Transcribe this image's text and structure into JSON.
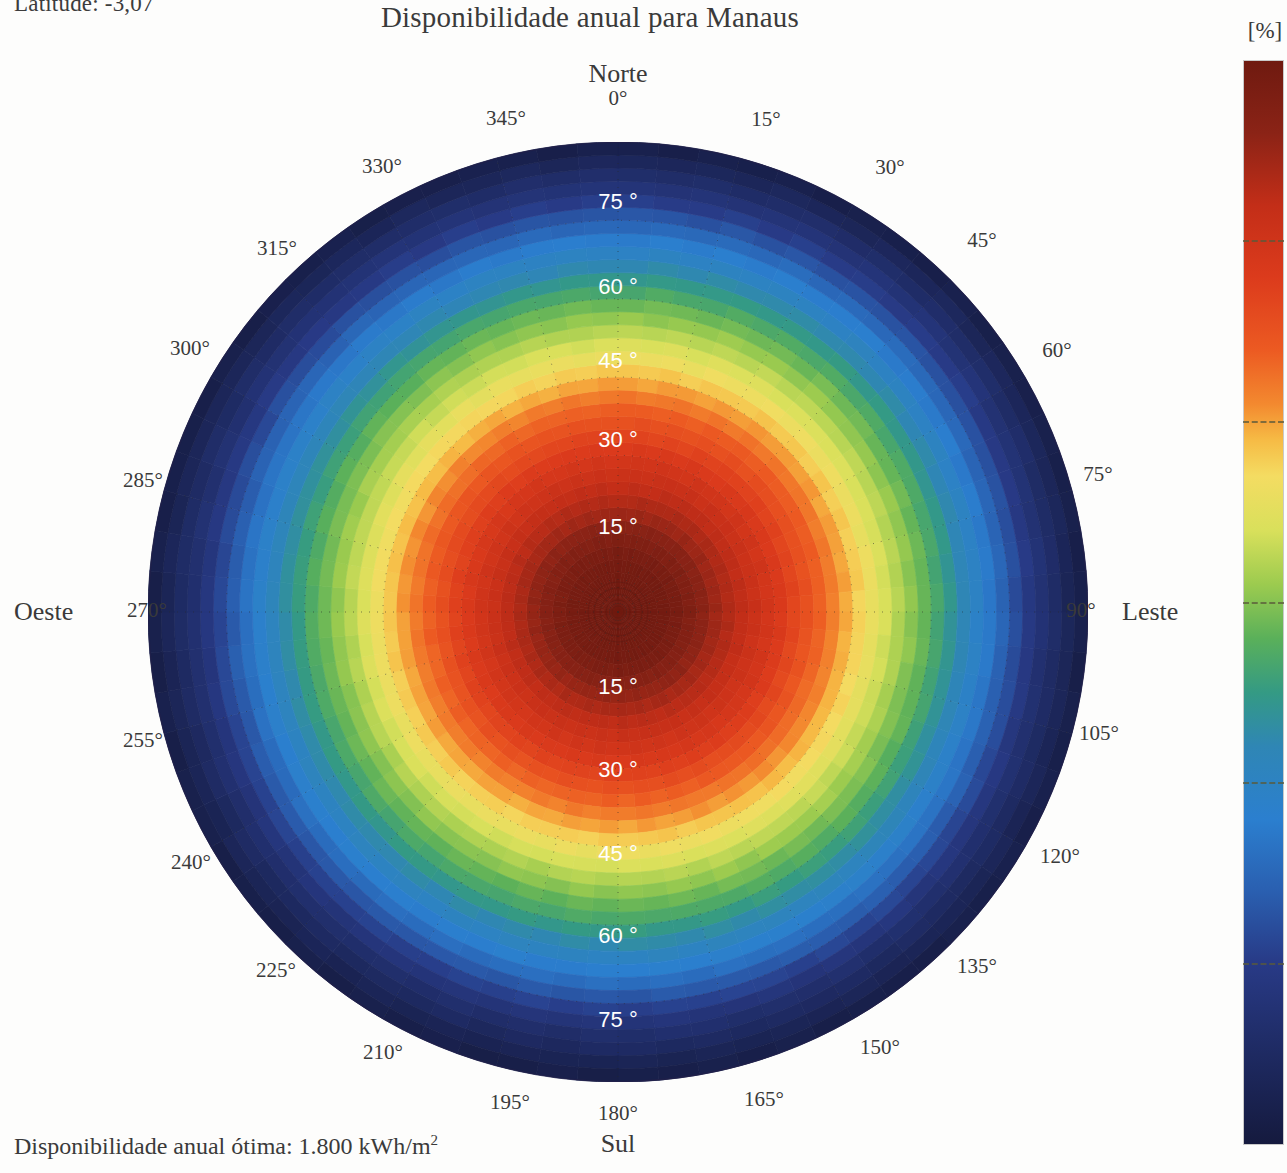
{
  "header": {
    "title": "Disponibilidade anual para Manaus",
    "latitude_note": "Latitude: -3,07"
  },
  "footer": {
    "optimum_label": "Disponibilidade anual ótima: 1.800 kWh/m",
    "optimum_exponent": "2"
  },
  "cardinals": {
    "north": "Norte",
    "south": "Sul",
    "west": "Oeste",
    "east": "Leste"
  },
  "colorbar": {
    "unit": "[%]",
    "ticks": [
      100,
      90,
      80,
      70,
      60,
      50,
      40
    ],
    "min": 40,
    "max": 100,
    "stops": [
      {
        "value": 100,
        "color": "#6f1a10"
      },
      {
        "value": 96,
        "color": "#8b2316"
      },
      {
        "value": 92,
        "color": "#c32e18"
      },
      {
        "value": 88,
        "color": "#dc3b1c"
      },
      {
        "value": 84,
        "color": "#ec5a22"
      },
      {
        "value": 81,
        "color": "#f3892f"
      },
      {
        "value": 79,
        "color": "#f6bb45"
      },
      {
        "value": 77,
        "color": "#f4dc62"
      },
      {
        "value": 74,
        "color": "#d9e05b"
      },
      {
        "value": 71,
        "color": "#9ccb4f"
      },
      {
        "value": 68,
        "color": "#5ab05a"
      },
      {
        "value": 65,
        "color": "#349a84"
      },
      {
        "value": 62,
        "color": "#2f86b5"
      },
      {
        "value": 58,
        "color": "#2b7fcf"
      },
      {
        "value": 54,
        "color": "#2a5fb0"
      },
      {
        "value": 50,
        "color": "#283a86"
      },
      {
        "value": 45,
        "color": "#1e2a62"
      },
      {
        "value": 40,
        "color": "#151a3e"
      }
    ]
  },
  "chart_data": {
    "type": "heatmap",
    "projection": "polar-skyplot",
    "title": "Disponibilidade anual para Manaus",
    "unit": "[%]",
    "zlim": [
      40,
      100
    ],
    "grid": true,
    "legend_position": "right",
    "angular_axis": {
      "name": "Azimute",
      "unit": "°",
      "range": [
        0,
        360
      ],
      "step": 15,
      "zero_at": "north",
      "direction": "clockwise",
      "tick_labels": [
        "0°",
        "15°",
        "30°",
        "45°",
        "60°",
        "75°",
        "90°",
        "105°",
        "120°",
        "135°",
        "150°",
        "165°",
        "180°",
        "195°",
        "210°",
        "225°",
        "240°",
        "255°",
        "270°",
        "285°",
        "300°",
        "315°",
        "330°",
        "345°"
      ]
    },
    "radial_axis": {
      "name": "Inclinação",
      "unit": "°",
      "range": [
        0,
        90
      ],
      "tick_labels": [
        "15 °",
        "30 °",
        "45 °",
        "60 °",
        "75 °"
      ],
      "ticks": [
        15,
        30,
        45,
        60,
        75
      ]
    },
    "radial_profile_north": [
      {
        "tilt": 0,
        "value": 100
      },
      {
        "tilt": 10,
        "value": 99
      },
      {
        "tilt": 15,
        "value": 97
      },
      {
        "tilt": 20,
        "value": 94
      },
      {
        "tilt": 30,
        "value": 89
      },
      {
        "tilt": 40,
        "value": 83
      },
      {
        "tilt": 45,
        "value": 79
      },
      {
        "tilt": 50,
        "value": 75
      },
      {
        "tilt": 60,
        "value": 68
      },
      {
        "tilt": 70,
        "value": 59
      },
      {
        "tilt": 75,
        "value": 54
      },
      {
        "tilt": 80,
        "value": 49
      },
      {
        "tilt": 90,
        "value": 41
      }
    ],
    "radial_profile_south": [
      {
        "tilt": 0,
        "value": 100
      },
      {
        "tilt": 10,
        "value": 99
      },
      {
        "tilt": 15,
        "value": 96
      },
      {
        "tilt": 20,
        "value": 93
      },
      {
        "tilt": 30,
        "value": 88
      },
      {
        "tilt": 40,
        "value": 81
      },
      {
        "tilt": 45,
        "value": 77
      },
      {
        "tilt": 50,
        "value": 73
      },
      {
        "tilt": 60,
        "value": 66
      },
      {
        "tilt": 70,
        "value": 57
      },
      {
        "tilt": 75,
        "value": 52
      },
      {
        "tilt": 80,
        "value": 47
      },
      {
        "tilt": 90,
        "value": 41
      }
    ],
    "annotations": {
      "optimum": "Disponibilidade anual ótima: 1.800 kWh/m2",
      "latitude": "Latitude: -3,07"
    }
  },
  "azimuth_ticks": [
    {
      "label": "0°",
      "x": 618,
      "y": 98
    },
    {
      "label": "15°",
      "x": 766,
      "y": 119
    },
    {
      "label": "30°",
      "x": 890,
      "y": 167
    },
    {
      "label": "45°",
      "x": 982,
      "y": 240
    },
    {
      "label": "60°",
      "x": 1057,
      "y": 350
    },
    {
      "label": "75°",
      "x": 1098,
      "y": 474
    },
    {
      "label": "90°",
      "x": 1081,
      "y": 610
    },
    {
      "label": "105°",
      "x": 1099,
      "y": 733
    },
    {
      "label": "120°",
      "x": 1060,
      "y": 856
    },
    {
      "label": "135°",
      "x": 977,
      "y": 966
    },
    {
      "label": "150°",
      "x": 880,
      "y": 1047
    },
    {
      "label": "165°",
      "x": 764,
      "y": 1099
    },
    {
      "label": "180°",
      "x": 618,
      "y": 1113
    },
    {
      "label": "195°",
      "x": 510,
      "y": 1102
    },
    {
      "label": "210°",
      "x": 383,
      "y": 1052
    },
    {
      "label": "225°",
      "x": 276,
      "y": 970
    },
    {
      "label": "240°",
      "x": 191,
      "y": 862
    },
    {
      "label": "255°",
      "x": 143,
      "y": 740
    },
    {
      "label": "270°",
      "x": 147,
      "y": 610
    },
    {
      "label": "285°",
      "x": 143,
      "y": 480
    },
    {
      "label": "300°",
      "x": 190,
      "y": 348
    },
    {
      "label": "315°",
      "x": 277,
      "y": 248
    },
    {
      "label": "330°",
      "x": 382,
      "y": 166
    },
    {
      "label": "345°",
      "x": 506,
      "y": 118
    }
  ],
  "radial_ring_labels": [
    {
      "label": "75 °",
      "x": 618,
      "y": 203
    },
    {
      "label": "60 °",
      "x": 618,
      "y": 288
    },
    {
      "label": "45 °",
      "x": 618,
      "y": 362
    },
    {
      "label": "30 °",
      "x": 618,
      "y": 441
    },
    {
      "label": "15 °",
      "x": 618,
      "y": 528
    },
    {
      "label": "15 °",
      "x": 618,
      "y": 688
    },
    {
      "label": "30 °",
      "x": 618,
      "y": 771
    },
    {
      "label": "45 °",
      "x": 618,
      "y": 855
    },
    {
      "label": "60 °",
      "x": 618,
      "y": 937
    },
    {
      "label": "75 °",
      "x": 618,
      "y": 1021
    }
  ]
}
